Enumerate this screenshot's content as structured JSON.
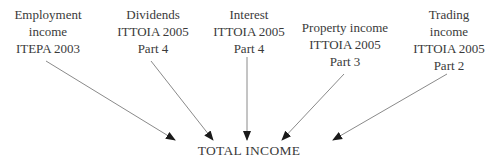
{
  "sources": [
    {
      "lines": [
        "Employment",
        "income",
        "ITEPA 2003"
      ]
    },
    {
      "lines": [
        "Dividends",
        "ITTOIA 2005",
        "Part 4"
      ]
    },
    {
      "lines": [
        "Interest",
        "ITTOIA 2005",
        "Part 4"
      ]
    },
    {
      "lines": [
        "Property income",
        "ITTOIA 2005",
        "Part 3"
      ]
    },
    {
      "lines": [
        "Trading",
        "income",
        "ITTOIA 2005",
        "Part 2"
      ]
    }
  ],
  "target": {
    "label": "TOTAL INCOME"
  },
  "colors": {
    "text": "#3a3a3a",
    "arrow": "#8a8a8a",
    "arrowhead": "#1a1a1a"
  }
}
